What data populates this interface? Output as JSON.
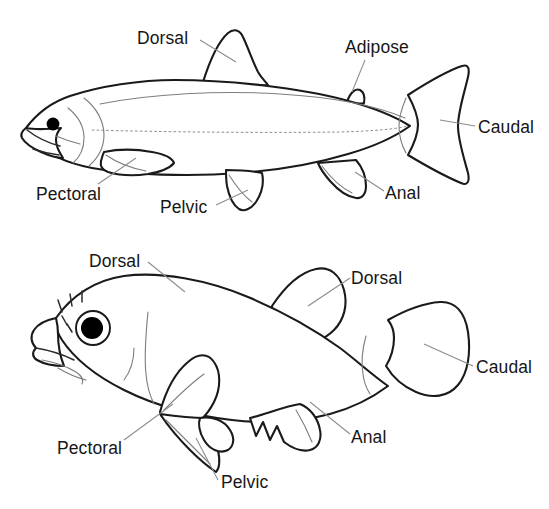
{
  "figure": {
    "type": "anatomy-diagram",
    "background_color": "#ffffff",
    "line_color": "#1a1a1a",
    "leader_color": "#8c8c8c",
    "text_color": "#161616"
  },
  "diagrams": [
    {
      "id": "trout",
      "name": "soft-rayed-fish",
      "labels": [
        {
          "key": "dorsal",
          "text": "Dorsal",
          "x": 137,
          "y": 30
        },
        {
          "key": "adipose",
          "text": "Adipose",
          "x": 345,
          "y": 39
        },
        {
          "key": "caudal",
          "text": "Caudal",
          "x": 478,
          "y": 119
        },
        {
          "key": "pectoral",
          "text": "Pectoral",
          "x": 36,
          "y": 186
        },
        {
          "key": "pelvic",
          "text": "Pelvic",
          "x": 160,
          "y": 199
        },
        {
          "key": "anal",
          "text": "Anal",
          "x": 385,
          "y": 185
        }
      ]
    },
    {
      "id": "perch",
      "name": "spiny-rayed-fish",
      "labels": [
        {
          "key": "dorsal-spiny",
          "text": "Dorsal",
          "x": 89,
          "y": 253
        },
        {
          "key": "dorsal-soft",
          "text": "Dorsal",
          "x": 351,
          "y": 270
        },
        {
          "key": "caudal",
          "text": "Caudal",
          "x": 476,
          "y": 359
        },
        {
          "key": "pectoral",
          "text": "Pectoral",
          "x": 57,
          "y": 440
        },
        {
          "key": "pelvic",
          "text": "Pelvic",
          "x": 221,
          "y": 474
        },
        {
          "key": "anal",
          "text": "Anal",
          "x": 351,
          "y": 429
        }
      ]
    }
  ]
}
